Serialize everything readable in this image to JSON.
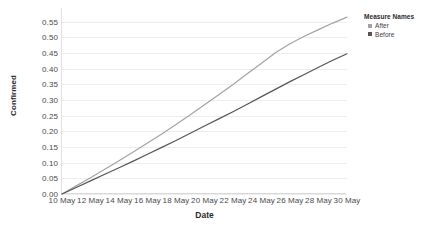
{
  "legend": {
    "title": "Measure Names",
    "items": [
      {
        "label": "After",
        "color": "#a3a3a3",
        "swatch_icon": "square-swatch-icon"
      },
      {
        "label": "Before",
        "color": "#555555",
        "swatch_icon": "square-swatch-icon"
      }
    ]
  },
  "axes": {
    "x_title": "Date",
    "y_title": "Confirmed"
  },
  "chart_data": {
    "type": "line",
    "title": "",
    "subtitle": "",
    "xlabel": "Date",
    "ylabel": "Confirmed",
    "grid": true,
    "legend_position": "right",
    "legend_title": "Measure Names",
    "x": [
      "10 May",
      "11 May",
      "12 May",
      "13 May",
      "14 May",
      "15 May",
      "16 May",
      "17 May",
      "18 May",
      "19 May",
      "20 May",
      "21 May",
      "22 May",
      "23 May",
      "24 May",
      "25 May",
      "26 May",
      "27 May",
      "28 May",
      "29 May",
      "30 May"
    ],
    "xtick_labels": [
      "10 May",
      "12 May",
      "14 May",
      "16 May",
      "18 May",
      "20 May",
      "22 May",
      "24 May",
      "26 May",
      "28 May",
      "30 May"
    ],
    "ytick_labels": [
      "0.00",
      "0.05",
      "0.10",
      "0.15",
      "0.20",
      "0.25",
      "0.30",
      "0.35",
      "0.40",
      "0.45",
      "0.50",
      "0.55"
    ],
    "ylim": [
      0.0,
      0.575
    ],
    "ytick_values": [
      0.0,
      0.05,
      0.1,
      0.15,
      0.2,
      0.25,
      0.3,
      0.35,
      0.4,
      0.45,
      0.5,
      0.55
    ],
    "series": [
      {
        "name": "After",
        "color": "#a3a3a3",
        "values": [
          0.0,
          0.026,
          0.052,
          0.079,
          0.106,
          0.134,
          0.163,
          0.192,
          0.222,
          0.253,
          0.285,
          0.317,
          0.35,
          0.384,
          0.418,
          0.452,
          0.48,
          0.504,
          0.525,
          0.546,
          0.565
        ]
      },
      {
        "name": "Before",
        "color": "#555555",
        "values": [
          0.0,
          0.021,
          0.042,
          0.063,
          0.084,
          0.105,
          0.127,
          0.149,
          0.171,
          0.194,
          0.217,
          0.24,
          0.263,
          0.287,
          0.311,
          0.335,
          0.359,
          0.382,
          0.405,
          0.427,
          0.448
        ]
      }
    ]
  }
}
